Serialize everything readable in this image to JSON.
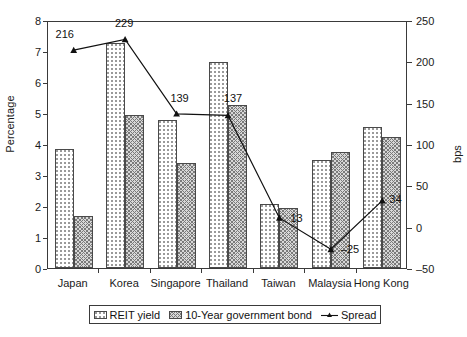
{
  "chart_data": {
    "type": "bar",
    "title": "",
    "subtitle": "",
    "categories": [
      "Japan",
      "Korea",
      "Singapore",
      "Thailand",
      "Taiwan",
      "Malaysia",
      "Hong Kong"
    ],
    "series": [
      {
        "name": "REIT yield",
        "axis": "left",
        "unit": "%",
        "values": [
          3.85,
          7.25,
          4.77,
          6.65,
          2.05,
          3.48,
          4.55
        ]
      },
      {
        "name": "10-Year government bond",
        "axis": "left",
        "unit": "%",
        "values": [
          1.67,
          4.95,
          3.38,
          5.27,
          1.93,
          3.75,
          4.22
        ]
      },
      {
        "name": "Spread",
        "axis": "right",
        "unit": "bps",
        "type": "line",
        "values": [
          216,
          229,
          139,
          137,
          13,
          -25,
          34
        ]
      }
    ],
    "data_labels": [
      "216",
      "229",
      "139",
      "137",
      "13",
      "-25",
      "34"
    ],
    "xlabel": "",
    "ylabel": "Percentage",
    "y2label": "bps",
    "ylim": [
      0,
      8
    ],
    "y2lim": [
      -50,
      250
    ],
    "yticks": [
      "0",
      "1",
      "2",
      "3",
      "4",
      "5",
      "6",
      "7",
      "8"
    ],
    "y2ticks": [
      "-50",
      "0",
      "50",
      "100",
      "150",
      "200",
      "250"
    ],
    "grid": false,
    "legend_position": "bottom",
    "legend": [
      "REIT yield",
      "10-Year government bond",
      "Spread"
    ]
  },
  "axes": {
    "y_label": "Percentage",
    "y2_label": "bps"
  },
  "legend": {
    "items": [
      {
        "label": "REIT yield",
        "marker": "bar-dotted-swatch"
      },
      {
        "label": "10-Year government bond",
        "marker": "bar-hatched-swatch"
      },
      {
        "label": "Spread",
        "marker": "line-marker"
      }
    ]
  }
}
